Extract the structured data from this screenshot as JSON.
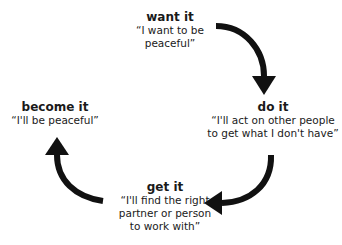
{
  "diagram": {
    "type": "cycle",
    "direction": "clockwise",
    "nodes": [
      {
        "id": "want",
        "title": "want it",
        "quote": "“I want to be\npeaceful”"
      },
      {
        "id": "do",
        "title": "do it",
        "quote": "“I'll act on other people\nto get what I don't have”"
      },
      {
        "id": "get",
        "title": "get it",
        "quote": "“I'll find the right\npartner or person\nto work with”"
      },
      {
        "id": "become",
        "title": "become it",
        "quote": "“I'll be peaceful”"
      }
    ],
    "edges": [
      {
        "from": "want",
        "to": "do"
      },
      {
        "from": "do",
        "to": "get"
      },
      {
        "from": "get",
        "to": "become"
      }
    ],
    "arrow_color": "#111111"
  }
}
